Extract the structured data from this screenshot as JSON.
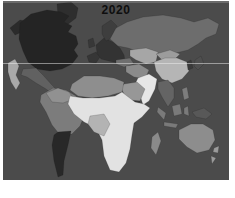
{
  "page": {
    "background": "#ffffff"
  },
  "map": {
    "title": "2020",
    "title_color": "#0e0e0e",
    "ocean_color": "#4b4b4b",
    "scanline_color": "rgba(240,240,240,0.5)",
    "regions": {
      "alaska": {
        "label": "Alaska",
        "color": "#2b2b2b"
      },
      "canada_usa": {
        "label": "Canada & United States",
        "color": "#242424"
      },
      "western_usa": {
        "label": "US West Coast",
        "color": "#a9a9a9"
      },
      "greenland": {
        "label": "Greenland",
        "color": "#2e2e2e"
      },
      "mexico_central_america": {
        "label": "Mexico & Central America",
        "color": "#616161"
      },
      "northern_south_america": {
        "label": "Northern South America",
        "color": "#7c7c7c"
      },
      "colombia_venezuela": {
        "label": "Colombia & Venezuela",
        "color": "#919191"
      },
      "southern_cone": {
        "label": "Argentina & Chile",
        "color": "#282828"
      },
      "iberia": {
        "label": "Iberian Peninsula",
        "color": "#363636"
      },
      "europe": {
        "label": "Europe",
        "color": "#333333"
      },
      "scandinavia": {
        "label": "Scandinavia",
        "color": "#3e3e3e"
      },
      "british_isles": {
        "label": "British Isles",
        "color": "#383838"
      },
      "russia": {
        "label": "Russia",
        "color": "#6d6d6d"
      },
      "central_asia": {
        "label": "Central Asia",
        "color": "#a6a6a6"
      },
      "mongolia": {
        "label": "Mongolia",
        "color": "#9c9c9c"
      },
      "china": {
        "label": "China",
        "color": "#b5b5b5"
      },
      "india": {
        "label": "India",
        "color": "#e7e7e7"
      },
      "iran_pakistan": {
        "label": "Iran & Pakistan",
        "color": "#8b8b8b"
      },
      "turkey": {
        "label": "Turkey",
        "color": "#6f6f6f"
      },
      "arabia": {
        "label": "Arabian Peninsula",
        "color": "#979797"
      },
      "yemen": {
        "label": "Yemen",
        "color": "#3c3c3c"
      },
      "north_africa": {
        "label": "North Africa",
        "color": "#8e8e8e"
      },
      "sub_saharan_africa": {
        "label": "Sub-Saharan Africa",
        "color": "#e2e2e2"
      },
      "central_africa": {
        "label": "Central Africa",
        "color": "#b3b3b3"
      },
      "madagascar": {
        "label": "Madagascar",
        "color": "#8a8a8a"
      },
      "southeast_asia": {
        "label": "Southeast Asia",
        "color": "#646464"
      },
      "indonesia": {
        "label": "Indonesia",
        "color": "#7a7a7a"
      },
      "philippines": {
        "label": "Philippines",
        "color": "#7d7d7d"
      },
      "japan": {
        "label": "Japan",
        "color": "#4f4f4f"
      },
      "korea": {
        "label": "Korea",
        "color": "#3a3a3a"
      },
      "new_guinea": {
        "label": "New Guinea",
        "color": "#585858"
      },
      "australia": {
        "label": "Australia",
        "color": "#8d8d8d"
      },
      "new_zealand": {
        "label": "New Zealand",
        "color": "#9b9b9b"
      }
    }
  }
}
